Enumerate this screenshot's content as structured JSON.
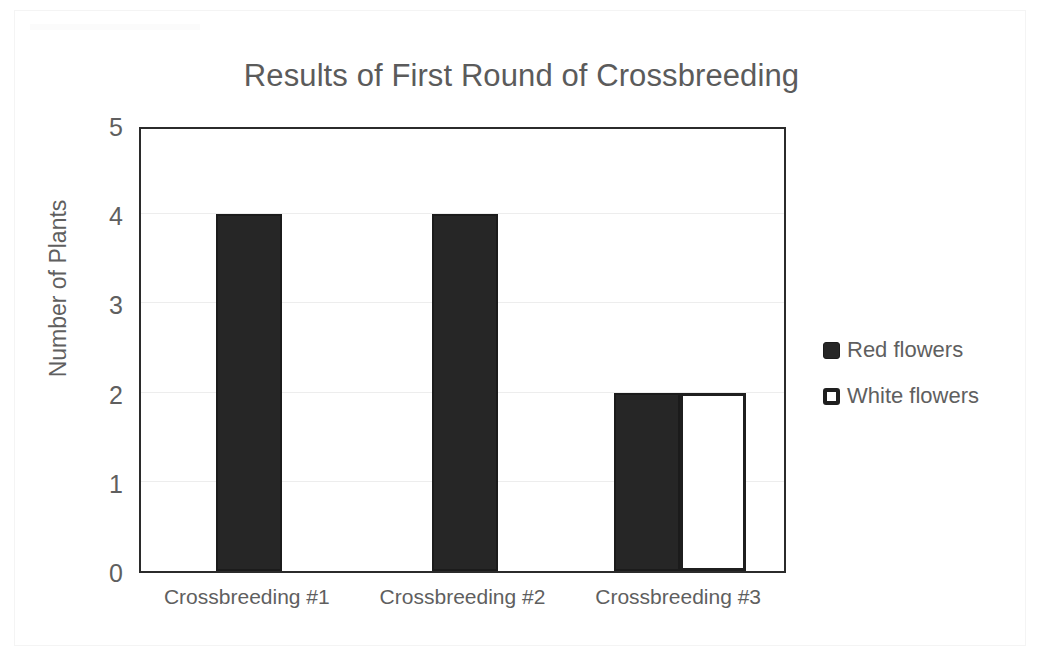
{
  "chart_data": {
    "type": "bar",
    "title": "Results of First Round of Crossbreeding",
    "xlabel": "",
    "ylabel": "Number of Plants",
    "categories": [
      "Crossbreeding #1",
      "Crossbreeding #2",
      "Crossbreeding #3"
    ],
    "series": [
      {
        "name": "Red flowers",
        "values": [
          4,
          4,
          2
        ],
        "color": "#262626"
      },
      {
        "name": "White flowers",
        "values": [
          0,
          0,
          2
        ],
        "color": "#ffffff"
      }
    ],
    "ylim": [
      0,
      5
    ],
    "yticks": [
      0,
      1,
      2,
      3,
      4,
      5
    ],
    "ytick_labels": [
      "0",
      "1",
      "2",
      "3",
      "4",
      "5"
    ],
    "grid": true,
    "grid_color": "#ededed",
    "legend_position": "right",
    "legend": [
      {
        "label": "Red flowers",
        "swatch": "filled",
        "color": "#262626"
      },
      {
        "label": "White flowers",
        "swatch": "hollow",
        "color": "#ffffff"
      }
    ],
    "plot_border_color": "#2b2b2b",
    "text_color": "#5f5f5f",
    "background": "#ffffff"
  }
}
